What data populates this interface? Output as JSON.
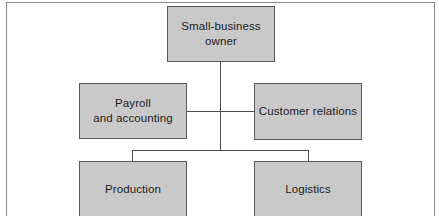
{
  "diagram": {
    "type": "org-chart",
    "colors": {
      "box_fill": "#c9c9c9",
      "box_border": "#5a5a5a",
      "line": "#4a4a4a",
      "text": "#1c1c1c",
      "background": "#ffffff"
    },
    "nodes": [
      {
        "id": "owner",
        "label": "Small-business\nowner",
        "level": 0
      },
      {
        "id": "payroll",
        "label": "Payroll\nand accounting",
        "level": 1,
        "side": "left"
      },
      {
        "id": "customer",
        "label": "Customer relations",
        "level": 1,
        "side": "right"
      },
      {
        "id": "production",
        "label": "Production",
        "level": 2,
        "side": "left"
      },
      {
        "id": "logistics",
        "label": "Logistics",
        "level": 2,
        "side": "right"
      }
    ],
    "edges": [
      {
        "from": "owner",
        "to": "payroll"
      },
      {
        "from": "owner",
        "to": "customer"
      },
      {
        "from": "owner",
        "to": "production"
      },
      {
        "from": "owner",
        "to": "logistics"
      }
    ]
  }
}
